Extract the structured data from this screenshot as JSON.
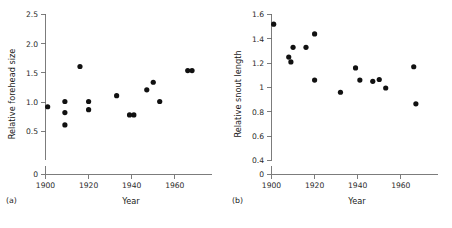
{
  "figure": {
    "background_color": "#ffffff",
    "point_color": "#111111",
    "axis_color": "#6e6e6e"
  },
  "panels": [
    {
      "caption": "(a)",
      "xlabel": "Year",
      "ylabel": "Relative forehead size"
    },
    {
      "caption": "(b)",
      "xlabel": "Year",
      "ylabel": "Relative snout length"
    }
  ],
  "chart_data": [
    {
      "type": "scatter",
      "panel": "(a)",
      "title": "",
      "xlabel": "Year",
      "ylabel": "Relative forehead size",
      "xlim": [
        1900,
        1972
      ],
      "ylim": [
        0,
        2.5
      ],
      "xticks": [
        1900,
        1920,
        1940,
        1960
      ],
      "xtick_labels": [
        "1900",
        "1920",
        "1940",
        "1960"
      ],
      "yticks": [
        0,
        0.5,
        1.0,
        1.5,
        2.0,
        2.5
      ],
      "ytick_labels": [
        "0",
        "0.5",
        "1.0",
        "1.5",
        "2.0",
        "2.5"
      ],
      "y_axis_break": true,
      "y_axis_break_between": [
        0,
        0.5
      ],
      "grid": false,
      "legend": null,
      "points": [
        {
          "x": 1901,
          "y": 0.92
        },
        {
          "x": 1909,
          "y": 1.01
        },
        {
          "x": 1909,
          "y": 0.82
        },
        {
          "x": 1909,
          "y": 0.61
        },
        {
          "x": 1916,
          "y": 1.61
        },
        {
          "x": 1920,
          "y": 1.01
        },
        {
          "x": 1920,
          "y": 0.87
        },
        {
          "x": 1933,
          "y": 1.11
        },
        {
          "x": 1939,
          "y": 0.78
        },
        {
          "x": 1941,
          "y": 0.78
        },
        {
          "x": 1947,
          "y": 1.21
        },
        {
          "x": 1950,
          "y": 1.34
        },
        {
          "x": 1953,
          "y": 1.01
        },
        {
          "x": 1966,
          "y": 1.54
        },
        {
          "x": 1968,
          "y": 1.54
        }
      ]
    },
    {
      "type": "scatter",
      "panel": "(b)",
      "title": "",
      "xlabel": "Year",
      "ylabel": "Relative snout length",
      "xlim": [
        1900,
        1972
      ],
      "ylim": [
        0,
        1.6
      ],
      "xticks": [
        1900,
        1920,
        1940,
        1960
      ],
      "xtick_labels": [
        "1900",
        "1920",
        "1940",
        "1960"
      ],
      "yticks": [
        0,
        0.4,
        0.6,
        0.8,
        1.0,
        1.2,
        1.4,
        1.6
      ],
      "ytick_labels": [
        "0",
        "0.4",
        "0.6",
        "0.8",
        "1",
        "1.2",
        "1.4",
        "1.6"
      ],
      "y_axis_break": true,
      "y_axis_break_between": [
        0,
        0.4
      ],
      "grid": false,
      "legend": null,
      "points": [
        {
          "x": 1901,
          "y": 1.52
        },
        {
          "x": 1908,
          "y": 1.25
        },
        {
          "x": 1909,
          "y": 1.21
        },
        {
          "x": 1910,
          "y": 1.33
        },
        {
          "x": 1916,
          "y": 1.33
        },
        {
          "x": 1920,
          "y": 1.44
        },
        {
          "x": 1920,
          "y": 1.06
        },
        {
          "x": 1932,
          "y": 0.96
        },
        {
          "x": 1939,
          "y": 1.16
        },
        {
          "x": 1941,
          "y": 1.06
        },
        {
          "x": 1947,
          "y": 1.05
        },
        {
          "x": 1950,
          "y": 1.065
        },
        {
          "x": 1953,
          "y": 0.995
        },
        {
          "x": 1966,
          "y": 1.17
        },
        {
          "x": 1967,
          "y": 0.865
        }
      ]
    }
  ]
}
